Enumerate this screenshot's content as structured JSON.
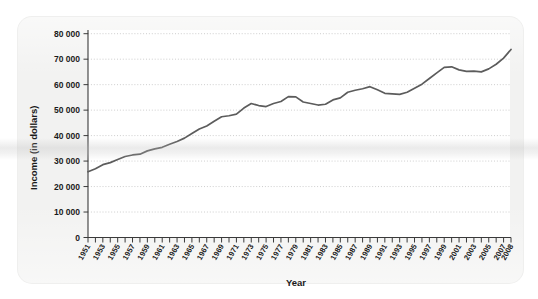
{
  "figure": {
    "background_color": "#f2f2f1",
    "line_color": "#5c5c5c",
    "grid_color": "#b9b9b9",
    "axis_color": "#3a3a3a"
  },
  "chart_data": {
    "type": "line",
    "title": "",
    "xlabel": "Year",
    "ylabel": "Income (in dollars)",
    "xlim": [
      1951,
      2008
    ],
    "ylim": [
      0,
      80000
    ],
    "grid": true,
    "legend": false,
    "ytick_labels": [
      "0",
      "10 000",
      "20 000",
      "30 000",
      "40 000",
      "50 000",
      "60 000",
      "70 000",
      "80 000"
    ],
    "ytick_values": [
      0,
      10000,
      20000,
      30000,
      40000,
      50000,
      60000,
      70000,
      80000
    ],
    "xtick_labels": [
      "1951",
      "1953",
      "1955",
      "1957",
      "1959",
      "1961",
      "1963",
      "1965",
      "1967",
      "1969",
      "1971",
      "1973",
      "1975",
      "1977",
      "1979",
      "1981",
      "1983",
      "1985",
      "1987",
      "1989",
      "1991",
      "1993",
      "1995",
      "1997",
      "1999",
      "2001",
      "2003",
      "2005",
      "2007",
      "2008"
    ],
    "x": [
      1951,
      1952,
      1953,
      1954,
      1955,
      1956,
      1957,
      1958,
      1959,
      1960,
      1961,
      1962,
      1963,
      1964,
      1965,
      1966,
      1967,
      1968,
      1969,
      1970,
      1971,
      1972,
      1973,
      1974,
      1975,
      1976,
      1977,
      1978,
      1979,
      1980,
      1981,
      1982,
      1983,
      1984,
      1985,
      1986,
      1987,
      1988,
      1989,
      1990,
      1991,
      1992,
      1993,
      1994,
      1995,
      1996,
      1997,
      1998,
      1999,
      2000,
      2001,
      2002,
      2003,
      2004,
      2005,
      2006,
      2007,
      2008
    ],
    "series": [
      {
        "name": "Income",
        "values": [
          25800,
          27000,
          28600,
          29400,
          30600,
          31800,
          32400,
          32700,
          34000,
          34800,
          35400,
          36600,
          37700,
          39000,
          40800,
          42600,
          43800,
          45600,
          47400,
          47800,
          48400,
          50800,
          52600,
          51800,
          51400,
          52600,
          53400,
          55300,
          55200,
          53200,
          52600,
          52000,
          52300,
          54000,
          54800,
          57000,
          57800,
          58400,
          59200,
          58000,
          56600,
          56400,
          56200,
          57000,
          58600,
          60200,
          62400,
          64600,
          66800,
          67000,
          65800,
          65200,
          65300,
          65000,
          66200,
          68000,
          70400,
          73800
        ]
      }
    ]
  }
}
